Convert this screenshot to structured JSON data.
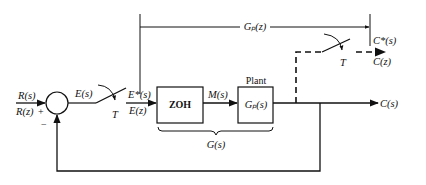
{
  "diagram": {
    "type": "sampled-data closed-loop control block diagram",
    "input": {
      "top": "R(s)",
      "bottom": "R(z)"
    },
    "summing_junction": {
      "plus_sign": "+",
      "minus_sign": "−"
    },
    "error": {
      "continuous": "E(s)",
      "sampled_top": "E*(s)",
      "sampled_bottom": "E(z)"
    },
    "sampler_period": "T",
    "blocks": [
      {
        "id": "zoh",
        "label": "ZOH"
      },
      {
        "id": "plant",
        "title": "Plant",
        "label": "Gₚ(s)"
      }
    ],
    "intermediate_signal": "M(s)",
    "brace_label": "G(s)",
    "pulse_transfer_label": "Gₚ(z)",
    "output": {
      "continuous": "C(s)",
      "sampled_top": "C*(s)",
      "sampled_bottom": "C(z)"
    },
    "output_sampler_period": "T",
    "colors": {
      "line": "#111111",
      "background": "#ffffff"
    }
  }
}
